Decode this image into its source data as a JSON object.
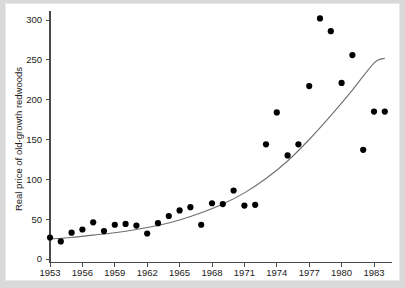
{
  "figure": {
    "background_color": "#d9d9d9",
    "plot_background_color": "#ffffff",
    "point_color": "#000000",
    "curve_color": "#6e6e6e",
    "axis_color": "#4a4a4a"
  },
  "chart_data": {
    "type": "scatter",
    "title": "",
    "subtitle": "",
    "xlabel": "",
    "ylabel": "Real price of old-growth redwoods",
    "xlim": [
      1953,
      1984
    ],
    "ylim": [
      0,
      315
    ],
    "grid": false,
    "legend": "none",
    "xticks": [
      1953,
      1956,
      1959,
      1962,
      1965,
      1968,
      1971,
      1974,
      1977,
      1980,
      1983
    ],
    "xticklabels": [
      "1953",
      "1956",
      "1959",
      "1962",
      "1965",
      "1968",
      "1971",
      "1974",
      "1977",
      "1980",
      "1983"
    ],
    "yticks": [
      0,
      50,
      100,
      150,
      200,
      250,
      300
    ],
    "yticklabels": [
      "0",
      "50",
      "100",
      "150",
      "200",
      "250",
      "300"
    ],
    "series": [
      {
        "name": "Real price of old-growth redwoods",
        "marker": "filled-circle",
        "x": [
          1953,
          1954,
          1955,
          1956,
          1957,
          1958,
          1959,
          1960,
          1961,
          1962,
          1963,
          1964,
          1965,
          1966,
          1967,
          1968,
          1969,
          1970,
          1971,
          1972,
          1973,
          1974,
          1975,
          1976,
          1977,
          1978,
          1979,
          1980,
          1981,
          1982,
          1983,
          1984
        ],
        "y": [
          27,
          22,
          33,
          37,
          46,
          35,
          43,
          44,
          42,
          32,
          45,
          54,
          61,
          65,
          43,
          70,
          69,
          86,
          67,
          68,
          144,
          184,
          130,
          144,
          217,
          302,
          286,
          221,
          256,
          137,
          185,
          185
        ]
      }
    ],
    "fit_curve": {
      "name": "exponential trend fit",
      "x": [
        1953,
        1955,
        1957,
        1959,
        1961,
        1963,
        1965,
        1967,
        1969,
        1971,
        1973,
        1975,
        1977,
        1979,
        1981,
        1983,
        1984
      ],
      "y": [
        25,
        27,
        30,
        33,
        37,
        42,
        49,
        58,
        69,
        83,
        101,
        123,
        150,
        180,
        212,
        246,
        252
      ]
    }
  }
}
